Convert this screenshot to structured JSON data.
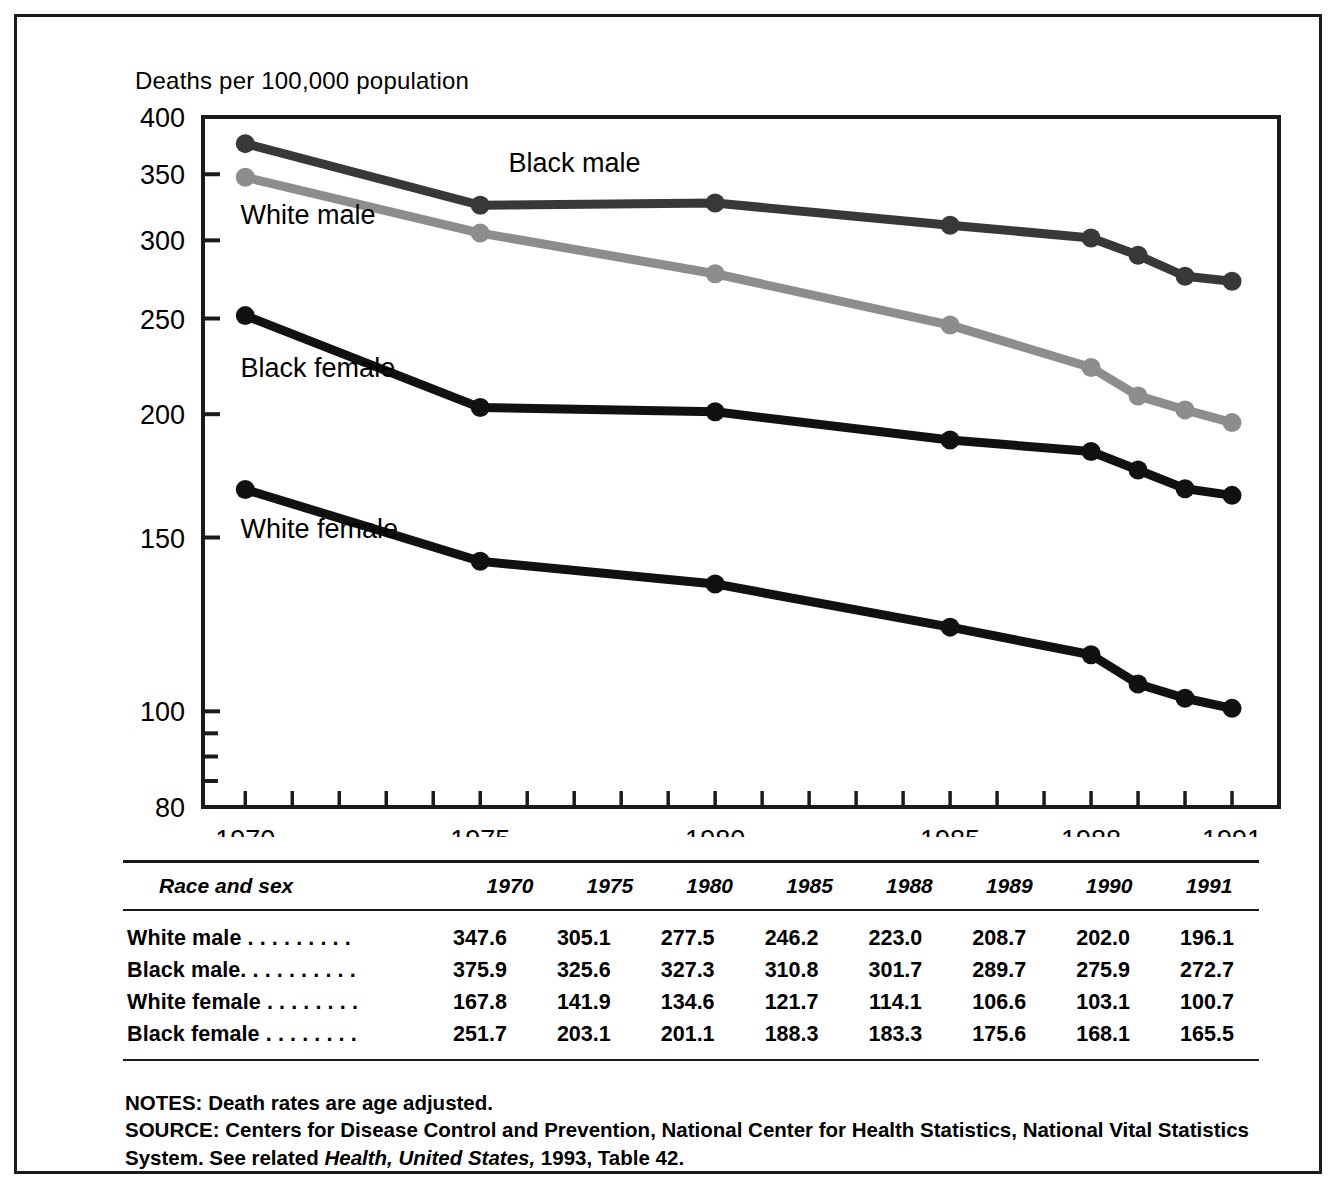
{
  "chart_data": {
    "type": "line",
    "title": "",
    "ylabel": "Deaths per 100,000 population",
    "xlabel": "",
    "x": [
      1970,
      1975,
      1980,
      1985,
      1988,
      1989,
      1990,
      1991
    ],
    "x_tick_labels": [
      "1970",
      "1975",
      "1980",
      "1985",
      "1988",
      "1991"
    ],
    "x_tick_values": [
      1970,
      1975,
      1980,
      1985,
      1988,
      1991
    ],
    "xlim": [
      1969.1,
      1992.0
    ],
    "y_tick_labels": [
      "400",
      "350",
      "300",
      "250",
      "200",
      "150",
      "100",
      "80"
    ],
    "y_tick_values": [
      400,
      350,
      300,
      250,
      200,
      150,
      100,
      80
    ],
    "y_minor_ticks": [
      95,
      90,
      85
    ],
    "ylim": [
      80,
      400
    ],
    "yscale": "log",
    "grid": false,
    "legend": "inline-labels",
    "series": [
      {
        "name": "Black male",
        "label": "Black male",
        "color": "#383838",
        "label_x": 1975.6,
        "label_y": 352,
        "values": [
          375.9,
          325.6,
          327.3,
          310.8,
          301.7,
          289.7,
          275.9,
          272.7
        ]
      },
      {
        "name": "White male",
        "label": "White male",
        "color": "#8d8d8d",
        "label_x": 1969.9,
        "label_y": 312,
        "values": [
          347.6,
          305.1,
          277.5,
          246.2,
          223.0,
          208.7,
          202.0,
          196.1
        ]
      },
      {
        "name": "Black female",
        "label": "Black female",
        "color": "#111111",
        "label_x": 1969.9,
        "label_y": 218,
        "values": [
          251.7,
          203.1,
          201.1,
          188.3,
          183.3,
          175.6,
          168.1,
          165.5
        ]
      },
      {
        "name": "White female",
        "label": "White female",
        "color": "#111111",
        "label_x": 1969.9,
        "label_y": 150,
        "values": [
          167.8,
          141.9,
          134.6,
          121.7,
          114.1,
          106.6,
          103.1,
          100.7
        ]
      }
    ]
  },
  "table": {
    "header_label": "Race and sex",
    "columns": [
      "1970",
      "1975",
      "1980",
      "1985",
      "1988",
      "1989",
      "1990",
      "1991"
    ],
    "rows": [
      {
        "label": "White male . . . . . . . . .",
        "values": [
          "347.6",
          "305.1",
          "277.5",
          "246.2",
          "223.0",
          "208.7",
          "202.0",
          "196.1"
        ]
      },
      {
        "label": "Black male. . . . . . . . . .",
        "values": [
          "375.9",
          "325.6",
          "327.3",
          "310.8",
          "301.7",
          "289.7",
          "275.9",
          "272.7"
        ]
      },
      {
        "label": "White female . . . . . . . .",
        "values": [
          "167.8",
          "141.9",
          "134.6",
          "121.7",
          "114.1",
          "106.6",
          "103.1",
          "100.7"
        ]
      },
      {
        "label": "Black female . . . . . . . .",
        "values": [
          "251.7",
          "203.1",
          "201.1",
          "188.3",
          "183.3",
          "175.6",
          "168.1",
          "165.5"
        ]
      }
    ]
  },
  "notes": {
    "notes_line": "NOTES: Death rates are age adjusted.",
    "source_prefix": "SOURCE: Centers for Disease Control and Prevention, National Center for Health Statistics, National Vital Statistics System. See related ",
    "source_italic": "Health, United States,",
    "source_suffix": " 1993, Table 42."
  },
  "colors": {
    "ink": "#1b1b1b",
    "black_male": "#383838",
    "white_male": "#8d8d8d",
    "black_female": "#111111",
    "white_female": "#111111"
  }
}
